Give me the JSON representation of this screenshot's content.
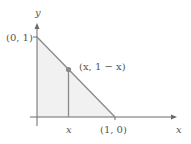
{
  "figure": {
    "axes": {
      "x_label": "x",
      "y_label": "y"
    },
    "points": {
      "y_intercept": "(0, 1)",
      "x_intercept": "(1, 0)",
      "curve_point": "(x, 1 − x)",
      "x_tick": "x"
    },
    "colors": {
      "line": "#8a8a8a",
      "axis": "#6a6a6a",
      "fill": "#f1f1f1",
      "dot": "#8a8a8a",
      "text": "#555555"
    }
  }
}
